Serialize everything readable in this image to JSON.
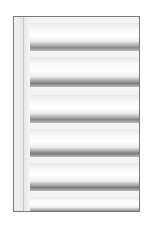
{
  "image": {
    "description": "Grayscale photograph of stacked white cylindrical rollers with dark shadow bands, inside a thin gray frame",
    "frame_color": "#7a7a7a",
    "rollers": [
      {
        "top": 6,
        "height": 28,
        "shadow": "#8c8c8c"
      },
      {
        "top": 40,
        "height": 30,
        "shadow": "#7d7d7d"
      },
      {
        "top": 78,
        "height": 28,
        "shadow": "#8a8a8a"
      },
      {
        "top": 112,
        "height": 28,
        "shadow": "#787878"
      },
      {
        "top": 146,
        "height": 28,
        "shadow": "#7b7b7b"
      },
      {
        "top": 180,
        "height": 16,
        "shadow": "#8e8e8e"
      }
    ]
  }
}
